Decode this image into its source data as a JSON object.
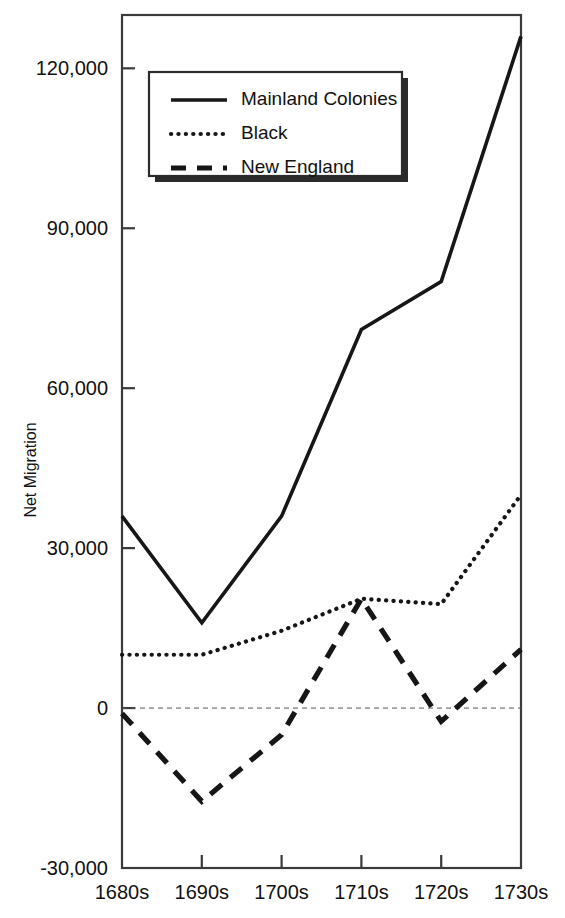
{
  "chart_data": {
    "type": "line",
    "title": "",
    "xlabel": "",
    "ylabel": "Net Migration",
    "categories": [
      "1680s",
      "1690s",
      "1700s",
      "1710s",
      "1720s",
      "1730s"
    ],
    "ylim": [
      -30000,
      130000
    ],
    "yticks": [
      -30000,
      0,
      30000,
      60000,
      90000,
      120000
    ],
    "ytick_labels": [
      "-30,000",
      "0",
      "30,000",
      "60,000",
      "90,000",
      "120,000"
    ],
    "grid": false,
    "zero_reference_line": true,
    "legend_position": "upper-left-inside",
    "series": [
      {
        "name": "Mainland Colonies",
        "style": "solid",
        "values": [
          36000,
          16000,
          36000,
          71000,
          80000,
          126000
        ]
      },
      {
        "name": "Black",
        "style": "dotted",
        "values": [
          10000,
          10000,
          14500,
          20500,
          19500,
          40000
        ]
      },
      {
        "name": "New England",
        "style": "dashed",
        "values": [
          -1000,
          -17500,
          -5000,
          20500,
          -2500,
          11000
        ]
      }
    ]
  },
  "legend": {
    "items": [
      {
        "label": "Mainland Colonies",
        "style": "solid"
      },
      {
        "label": "Black",
        "style": "dotted"
      },
      {
        "label": "New England",
        "style": "dashed"
      }
    ]
  }
}
